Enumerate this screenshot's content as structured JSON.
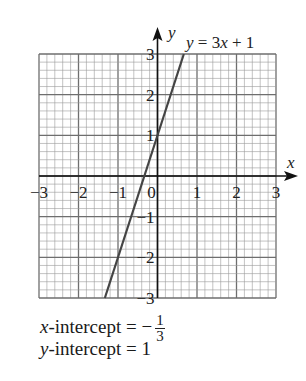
{
  "chart_data": {
    "type": "line",
    "title": "",
    "equation_label": "y = 3x + 1",
    "xlabel": "x",
    "ylabel": "y",
    "xlim": [
      -3,
      3
    ],
    "ylim": [
      -3,
      3
    ],
    "x_ticks": [
      "−3",
      "−2",
      "−1",
      "0",
      "1",
      "2",
      "3"
    ],
    "y_ticks": [
      "3",
      "2",
      "1",
      "−1",
      "−2",
      "−3"
    ],
    "grid": true,
    "minor_subdivisions": 5,
    "series": [
      {
        "name": "y = 3x + 1",
        "x": [
          -1.333,
          0.667
        ],
        "y": [
          -3,
          3
        ]
      }
    ],
    "annotations": [
      "x-intercept = −1/3",
      "y-intercept = 1"
    ]
  },
  "notes": {
    "x_intercept_prefix": "x",
    "x_intercept_label": "-intercept = −",
    "x_intercept_num": "1",
    "x_intercept_den": "3",
    "y_intercept_prefix": "y",
    "y_intercept_label": "-intercept = 1"
  },
  "colors": {
    "grid_minor": "#9a9a9a",
    "grid_major": "#6e6e6e",
    "axis": "#111111",
    "line": "#444444"
  }
}
